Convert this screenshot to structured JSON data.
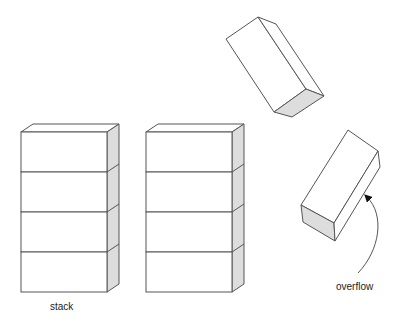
{
  "labels": {
    "stack": "stack",
    "overflow": "overflow"
  },
  "colors": {
    "stroke": "#555555",
    "side_fill": "#dddddd",
    "face_fill": "#ffffff"
  },
  "stacks": [
    {
      "name": "stack-1",
      "x": 21,
      "y": 132,
      "width": 86,
      "block_height": 40,
      "blocks": 4
    },
    {
      "name": "stack-2",
      "x": 146,
      "y": 132,
      "width": 86,
      "block_height": 40,
      "blocks": 4
    }
  ],
  "tilted_blocks": [
    {
      "name": "falling-block-top"
    },
    {
      "name": "falling-block-overflow"
    }
  ]
}
